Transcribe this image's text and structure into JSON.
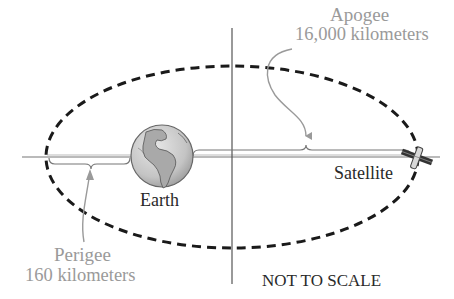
{
  "diagram": {
    "labels": {
      "apogee_title": "Apogee",
      "apogee_value": "16,000 kilometers",
      "perigee_title": "Perigee",
      "perigee_value": "160 kilometers",
      "earth": "Earth",
      "satellite": "Satellite",
      "note": "NOT TO SCALE"
    },
    "icons": [
      "earth-globe-icon",
      "satellite-icon"
    ],
    "colors": {
      "orbit": "#1a1a1a",
      "axis": "#555555",
      "annotation": "#9a9a9a",
      "text": "#2a2a2a"
    }
  }
}
